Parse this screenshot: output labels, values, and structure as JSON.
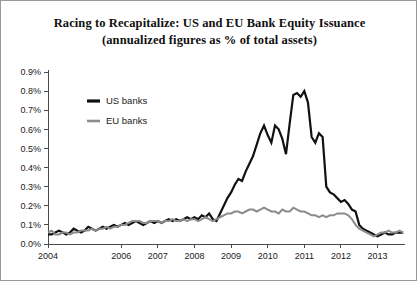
{
  "figure": {
    "title_line_1": "Racing to Recapitalize: US and EU Bank Equity Issuance",
    "title_line_2": "(annualized figures as % of total assets)"
  },
  "chart_data": {
    "type": "line",
    "title": "Racing to Recapitalize: US and EU Bank Equity Issuance (annualized figures as % of total assets)",
    "xlabel": "",
    "ylabel": "",
    "ylim": [
      0.0,
      0.9
    ],
    "xlim": [
      2004.0,
      2013.75
    ],
    "grid": false,
    "legend_position": "upper-left-inside",
    "ytick_labels": [
      "0.0%",
      "0.1%",
      "0.2%",
      "0.3%",
      "0.4%",
      "0.5%",
      "0.6%",
      "0.7%",
      "0.8%",
      "0.9%"
    ],
    "ytick_values": [
      0.0,
      0.1,
      0.2,
      0.3,
      0.4,
      0.5,
      0.6,
      0.7,
      0.8,
      0.9
    ],
    "xtick_labels": [
      "2004",
      "2006",
      "2007",
      "2008",
      "2009",
      "2010",
      "2011",
      "2012",
      "2013"
    ],
    "xtick_values": [
      2004,
      2006,
      2007,
      2008,
      2009,
      2010,
      2011,
      2012,
      2013
    ],
    "units": "percent of total assets (annualized)",
    "series": [
      {
        "name": "US banks",
        "color": "#111111",
        "linewidth": 2.2,
        "x": [
          2004.0,
          2004.1,
          2004.2,
          2004.3,
          2004.4,
          2004.5,
          2004.6,
          2004.7,
          2004.8,
          2004.9,
          2005.0,
          2005.1,
          2005.2,
          2005.3,
          2005.4,
          2005.5,
          2005.6,
          2005.7,
          2005.8,
          2005.9,
          2006.0,
          2006.1,
          2006.2,
          2006.3,
          2006.4,
          2006.5,
          2006.6,
          2006.7,
          2006.8,
          2006.9,
          2007.0,
          2007.1,
          2007.2,
          2007.3,
          2007.4,
          2007.5,
          2007.6,
          2007.7,
          2007.8,
          2007.9,
          2008.0,
          2008.1,
          2008.2,
          2008.3,
          2008.4,
          2008.5,
          2008.6,
          2008.7,
          2008.8,
          2008.9,
          2009.0,
          2009.1,
          2009.2,
          2009.3,
          2009.4,
          2009.5,
          2009.6,
          2009.7,
          2009.8,
          2009.9,
          2010.0,
          2010.1,
          2010.2,
          2010.3,
          2010.4,
          2010.5,
          2010.6,
          2010.7,
          2010.8,
          2010.9,
          2011.0,
          2011.1,
          2011.2,
          2011.3,
          2011.4,
          2011.5,
          2011.6,
          2011.7,
          2011.8,
          2011.9,
          2012.0,
          2012.1,
          2012.2,
          2012.3,
          2012.4,
          2012.5,
          2012.6,
          2012.7,
          2012.8,
          2012.9,
          2013.0,
          2013.1,
          2013.2,
          2013.3,
          2013.4,
          2013.5,
          2013.6,
          2013.7
        ],
        "values": [
          0.05,
          0.05,
          0.06,
          0.07,
          0.06,
          0.05,
          0.06,
          0.08,
          0.07,
          0.06,
          0.07,
          0.09,
          0.08,
          0.07,
          0.08,
          0.09,
          0.08,
          0.09,
          0.1,
          0.09,
          0.1,
          0.11,
          0.1,
          0.11,
          0.12,
          0.11,
          0.1,
          0.11,
          0.12,
          0.11,
          0.12,
          0.11,
          0.12,
          0.13,
          0.12,
          0.13,
          0.12,
          0.13,
          0.14,
          0.13,
          0.14,
          0.13,
          0.15,
          0.14,
          0.16,
          0.13,
          0.12,
          0.16,
          0.2,
          0.24,
          0.27,
          0.31,
          0.34,
          0.33,
          0.38,
          0.42,
          0.46,
          0.52,
          0.58,
          0.62,
          0.57,
          0.53,
          0.62,
          0.6,
          0.55,
          0.47,
          0.63,
          0.78,
          0.79,
          0.77,
          0.8,
          0.74,
          0.56,
          0.53,
          0.58,
          0.56,
          0.3,
          0.27,
          0.26,
          0.24,
          0.22,
          0.23,
          0.21,
          0.18,
          0.17,
          0.1,
          0.08,
          0.07,
          0.06,
          0.05,
          0.04,
          0.05,
          0.06,
          0.05,
          0.05,
          0.06,
          0.06,
          0.06
        ]
      },
      {
        "name": "EU banks",
        "color": "#8c8c8c",
        "linewidth": 2.0,
        "x": [
          2004.0,
          2004.1,
          2004.2,
          2004.3,
          2004.4,
          2004.5,
          2004.6,
          2004.7,
          2004.8,
          2004.9,
          2005.0,
          2005.1,
          2005.2,
          2005.3,
          2005.4,
          2005.5,
          2005.6,
          2005.7,
          2005.8,
          2005.9,
          2006.0,
          2006.1,
          2006.2,
          2006.3,
          2006.4,
          2006.5,
          2006.6,
          2006.7,
          2006.8,
          2006.9,
          2007.0,
          2007.1,
          2007.2,
          2007.3,
          2007.4,
          2007.5,
          2007.6,
          2007.7,
          2007.8,
          2007.9,
          2008.0,
          2008.1,
          2008.2,
          2008.3,
          2008.4,
          2008.5,
          2008.6,
          2008.7,
          2008.8,
          2008.9,
          2009.0,
          2009.1,
          2009.2,
          2009.3,
          2009.4,
          2009.5,
          2009.6,
          2009.7,
          2009.8,
          2009.9,
          2010.0,
          2010.1,
          2010.2,
          2010.3,
          2010.4,
          2010.5,
          2010.6,
          2010.7,
          2010.8,
          2010.9,
          2011.0,
          2011.1,
          2011.2,
          2011.3,
          2011.4,
          2011.5,
          2011.6,
          2011.7,
          2011.8,
          2011.9,
          2012.0,
          2012.1,
          2012.2,
          2012.3,
          2012.4,
          2012.5,
          2012.6,
          2012.7,
          2012.8,
          2012.9,
          2013.0,
          2013.1,
          2013.2,
          2013.3,
          2013.4,
          2013.5,
          2013.6,
          2013.7
        ],
        "values": [
          0.06,
          0.07,
          0.05,
          0.05,
          0.06,
          0.06,
          0.05,
          0.06,
          0.06,
          0.07,
          0.07,
          0.07,
          0.08,
          0.07,
          0.08,
          0.08,
          0.09,
          0.08,
          0.09,
          0.09,
          0.1,
          0.1,
          0.11,
          0.12,
          0.12,
          0.12,
          0.11,
          0.11,
          0.12,
          0.12,
          0.12,
          0.11,
          0.12,
          0.12,
          0.13,
          0.12,
          0.12,
          0.13,
          0.12,
          0.13,
          0.13,
          0.12,
          0.13,
          0.14,
          0.13,
          0.12,
          0.13,
          0.14,
          0.15,
          0.16,
          0.16,
          0.17,
          0.17,
          0.16,
          0.17,
          0.18,
          0.18,
          0.17,
          0.18,
          0.19,
          0.18,
          0.17,
          0.17,
          0.16,
          0.18,
          0.17,
          0.17,
          0.19,
          0.18,
          0.17,
          0.17,
          0.16,
          0.15,
          0.15,
          0.14,
          0.15,
          0.14,
          0.15,
          0.15,
          0.16,
          0.16,
          0.16,
          0.15,
          0.13,
          0.1,
          0.08,
          0.07,
          0.06,
          0.05,
          0.04,
          0.05,
          0.06,
          0.06,
          0.07,
          0.06,
          0.06,
          0.07,
          0.06
        ]
      }
    ]
  },
  "legend": {
    "items": [
      {
        "label": "US banks",
        "color": "#111111"
      },
      {
        "label": "EU banks",
        "color": "#8c8c8c"
      }
    ]
  }
}
